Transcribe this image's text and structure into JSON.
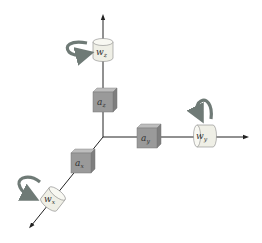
{
  "diagram": {
    "colors": {
      "axis": "#222222",
      "cube_front": "#9a9a9a",
      "cube_top": "#bdbdbd",
      "cube_side": "#7e7e7e",
      "cylinder_body": "#efefe6",
      "cylinder_top": "#f8f8f2",
      "rotation_arrow": "#6f7a76"
    },
    "axes": [
      {
        "name": "z",
        "direction": "up"
      },
      {
        "name": "y",
        "direction": "right"
      },
      {
        "name": "x",
        "direction": "down-left"
      }
    ],
    "accelerometers": [
      {
        "id": "a_z",
        "base": "a",
        "sub": "z"
      },
      {
        "id": "a_y",
        "base": "a",
        "sub": "y"
      },
      {
        "id": "a_x",
        "base": "a",
        "sub": "x"
      }
    ],
    "gyroscopes": [
      {
        "id": "w_z",
        "base": "w",
        "sub": "z"
      },
      {
        "id": "w_y",
        "base": "w",
        "sub": "y"
      },
      {
        "id": "w_x",
        "base": "w",
        "sub": "x"
      }
    ]
  }
}
